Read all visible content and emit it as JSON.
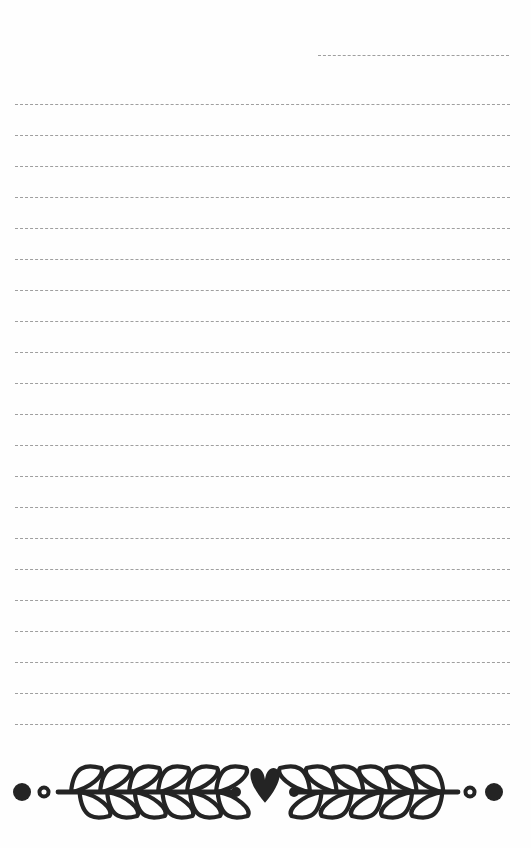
{
  "page": {
    "kind": "lined-notepaper-page",
    "width": 531,
    "height": 848,
    "background_color": "#fefefe",
    "title": "",
    "body_text": ""
  },
  "rules": {
    "color": "#9a9a9a",
    "style": "dashed",
    "thickness_px": 1.6,
    "dash_length_px": 7,
    "dash_gap_px": 3,
    "left_margin_px": 15,
    "right_edge_px": 510,
    "spacing_px": 31,
    "count": 22,
    "lines": [
      {
        "index": 0,
        "y": 55,
        "x_start": 318,
        "x_end": 509,
        "partial": true
      },
      {
        "index": 1,
        "y": 104,
        "x_start": 15,
        "x_end": 510,
        "partial": false
      },
      {
        "index": 2,
        "y": 135,
        "x_start": 15,
        "x_end": 510,
        "partial": false
      },
      {
        "index": 3,
        "y": 166,
        "x_start": 15,
        "x_end": 510,
        "partial": false
      },
      {
        "index": 4,
        "y": 197,
        "x_start": 15,
        "x_end": 510,
        "partial": false
      },
      {
        "index": 5,
        "y": 228,
        "x_start": 15,
        "x_end": 510,
        "partial": false
      },
      {
        "index": 6,
        "y": 259,
        "x_start": 15,
        "x_end": 510,
        "partial": false
      },
      {
        "index": 7,
        "y": 290,
        "x_start": 15,
        "x_end": 510,
        "partial": false
      },
      {
        "index": 8,
        "y": 321,
        "x_start": 15,
        "x_end": 510,
        "partial": false
      },
      {
        "index": 9,
        "y": 352,
        "x_start": 15,
        "x_end": 510,
        "partial": false
      },
      {
        "index": 10,
        "y": 383,
        "x_start": 15,
        "x_end": 510,
        "partial": false
      },
      {
        "index": 11,
        "y": 414,
        "x_start": 15,
        "x_end": 510,
        "partial": false
      },
      {
        "index": 12,
        "y": 445,
        "x_start": 15,
        "x_end": 510,
        "partial": false
      },
      {
        "index": 13,
        "y": 476,
        "x_start": 15,
        "x_end": 510,
        "partial": false
      },
      {
        "index": 14,
        "y": 507,
        "x_start": 15,
        "x_end": 510,
        "partial": false
      },
      {
        "index": 15,
        "y": 538,
        "x_start": 15,
        "x_end": 510,
        "partial": false
      },
      {
        "index": 16,
        "y": 569,
        "x_start": 15,
        "x_end": 510,
        "partial": false
      },
      {
        "index": 17,
        "y": 600,
        "x_start": 15,
        "x_end": 510,
        "partial": false
      },
      {
        "index": 18,
        "y": 631,
        "x_start": 15,
        "x_end": 510,
        "partial": false
      },
      {
        "index": 19,
        "y": 662,
        "x_start": 15,
        "x_end": 510,
        "partial": false
      },
      {
        "index": 20,
        "y": 693,
        "x_start": 15,
        "x_end": 510,
        "partial": false
      },
      {
        "index": 21,
        "y": 724,
        "x_start": 15,
        "x_end": 510,
        "partial": false
      }
    ]
  },
  "divider": {
    "name": "laurel-heart-divider",
    "color": "#242424",
    "baseline_y": 792,
    "top_y": 762,
    "height_px": 70,
    "symmetry": "mirrored-left-right",
    "center_motif": "heart",
    "center_x": 265,
    "stroke_width_px": 4.2,
    "elements": [
      {
        "name": "filled-dot-left-outer",
        "type": "filled-circle",
        "cx": 22,
        "cy": 792,
        "r": 9
      },
      {
        "name": "ring-dot-left-inner",
        "type": "ring-circle",
        "cx": 44,
        "cy": 792,
        "r": 6
      },
      {
        "name": "laurel-branch-left",
        "type": "laurel",
        "x_start": 58,
        "x_end": 232,
        "leaves_top": 6,
        "leaves_bottom": 6,
        "leaf_direction": "right"
      },
      {
        "name": "stem-dot-left",
        "type": "filled-circle",
        "cx": 236,
        "cy": 792,
        "r": 5
      },
      {
        "name": "heart-center",
        "type": "heart",
        "cx": 265,
        "cy": 785,
        "w": 36,
        "h": 34
      },
      {
        "name": "stem-dot-right",
        "type": "filled-circle",
        "cx": 294,
        "cy": 792,
        "r": 5
      },
      {
        "name": "laurel-branch-right",
        "type": "laurel",
        "x_start": 298,
        "x_end": 458,
        "leaves_top": 6,
        "leaves_bottom": 5,
        "leaf_direction": "left"
      },
      {
        "name": "ring-dot-right-inner",
        "type": "ring-circle",
        "cx": 470,
        "cy": 792,
        "r": 6
      },
      {
        "name": "filled-dot-right-outer",
        "type": "filled-circle",
        "cx": 494,
        "cy": 792,
        "r": 9
      }
    ]
  }
}
